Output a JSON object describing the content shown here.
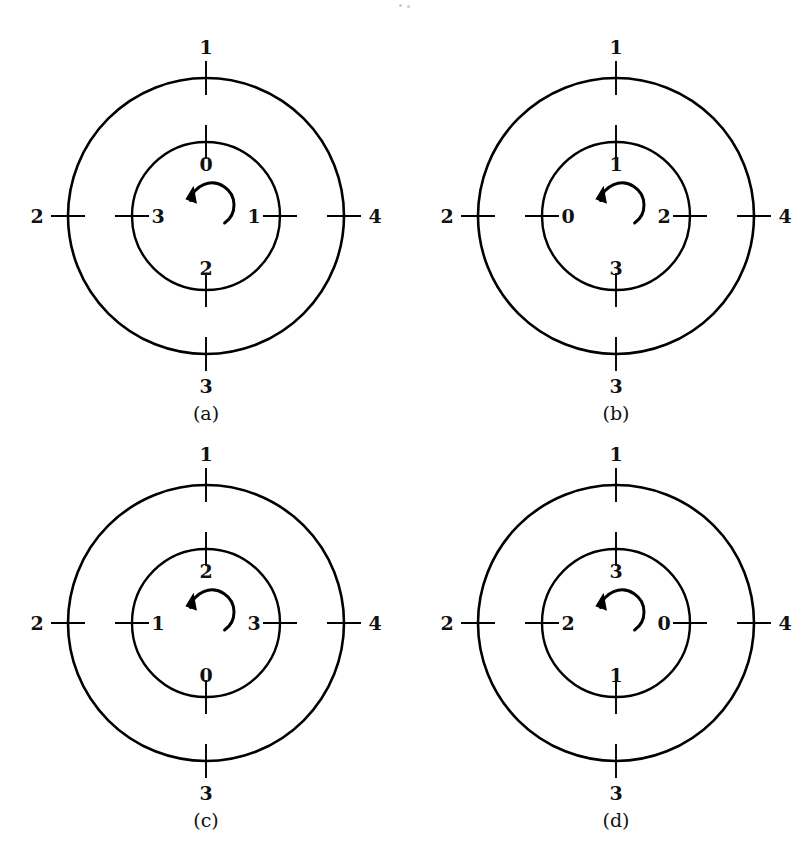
{
  "figure": {
    "background_color": "#ffffff",
    "stroke_color": "#000000",
    "label_color": "#111111",
    "rotation_direction": "counterclockwise",
    "arrow_icon": "counterclockwise-rotation-arrow"
  },
  "geometry": {
    "outer_radius": 138,
    "inner_radius": 74,
    "tick_overhang": 17,
    "arrow_radius": 22,
    "centers": [
      {
        "x": 206,
        "y": 216
      },
      {
        "x": 616,
        "y": 216
      },
      {
        "x": 206,
        "y": 623
      },
      {
        "x": 616,
        "y": 623
      }
    ]
  },
  "diagrams": [
    {
      "id": "a",
      "caption": "(a)",
      "outer": {
        "top": "1",
        "left": "2",
        "right": "4",
        "bottom": "3"
      },
      "inner": {
        "top": "0",
        "left": "3",
        "right": "1",
        "bottom": "2"
      }
    },
    {
      "id": "b",
      "caption": "(b)",
      "outer": {
        "top": "1",
        "left": "2",
        "right": "4",
        "bottom": "3"
      },
      "inner": {
        "top": "1",
        "left": "0",
        "right": "2",
        "bottom": "3"
      }
    },
    {
      "id": "c",
      "caption": "(c)",
      "outer": {
        "top": "1",
        "left": "2",
        "right": "4",
        "bottom": "3"
      },
      "inner": {
        "top": "2",
        "left": "1",
        "right": "3",
        "bottom": "0"
      }
    },
    {
      "id": "d",
      "caption": "(d)",
      "outer": {
        "top": "1",
        "left": "2",
        "right": "4",
        "bottom": "3"
      },
      "inner": {
        "top": "3",
        "left": "2",
        "right": "0",
        "bottom": "1"
      }
    }
  ]
}
